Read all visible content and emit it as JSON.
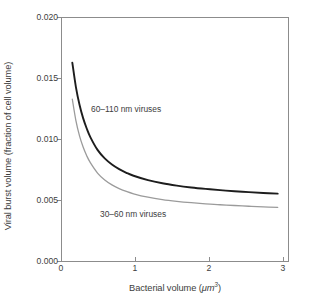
{
  "chart_data": {
    "type": "line",
    "title": "",
    "xlabel": "Bacterial volume (μm³)",
    "ylabel": "Viral burst volume (fraction of cell volume)",
    "xlim": [
      0,
      3.15
    ],
    "ylim": [
      0,
      0.02
    ],
    "grid": false,
    "legend_position": "inline-annotations",
    "xticks": [
      "0",
      "1",
      "2",
      "3"
    ],
    "xtick_values": [
      0,
      1,
      2,
      3
    ],
    "yticks": [
      "0.000",
      "0.005",
      "0.010",
      "0.015",
      "0.020"
    ],
    "ytick_values": [
      0.0,
      0.005,
      0.01,
      0.015,
      0.02
    ],
    "x": [
      0.15,
      0.2,
      0.25,
      0.3,
      0.35,
      0.4,
      0.5,
      0.6,
      0.7,
      0.8,
      0.9,
      1.0,
      1.2,
      1.4,
      1.6,
      1.8,
      2.0,
      2.2,
      2.4,
      2.6,
      2.8,
      3.0
    ],
    "series": [
      {
        "name": "60–110 nm viruses",
        "color": "#1d1d1d",
        "line_width": 1.9,
        "values": [
          0.0163,
          0.0143,
          0.01285,
          0.01175,
          0.0109,
          0.0102,
          0.00915,
          0.00845,
          0.00795,
          0.00757,
          0.00727,
          0.00703,
          0.00667,
          0.00641,
          0.00622,
          0.00607,
          0.00595,
          0.00585,
          0.00576,
          0.00569,
          0.00562,
          0.00556
        ]
      },
      {
        "name": "30–60 nm viruses",
        "color": "#9b9b9b",
        "line_width": 1.3,
        "values": [
          0.0133,
          0.01155,
          0.0103,
          0.00938,
          0.00867,
          0.0081,
          0.00725,
          0.00668,
          0.00628,
          0.00598,
          0.00574,
          0.00555,
          0.00527,
          0.00507,
          0.00493,
          0.00482,
          0.00473,
          0.00465,
          0.00459,
          0.00453,
          0.00448,
          0.00443
        ]
      }
    ],
    "annotations": [
      {
        "text": "60–110 nm viruses",
        "x": 0.43,
        "y": 0.0128
      },
      {
        "text": "30–60 nm viruses",
        "x": 0.55,
        "y": 0.0042
      }
    ],
    "axis_color": "#8c8c8c",
    "text_color": "#3d3d3d",
    "background": "#ffffff"
  },
  "ylabel_parts": {
    "text": "Viral burst volume (fraction of cell volume)"
  }
}
